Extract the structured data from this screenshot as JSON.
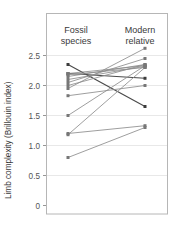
{
  "figure": {
    "background": "#ffffff",
    "frame_color": "#b6b6b6",
    "grid_color": "#e2e2e2"
  },
  "axis": {
    "y_label": "Limb complexity (Brillouin index)",
    "tick_labels": [
      "2.5",
      "2.0",
      "1.5",
      "1.0",
      "0.5",
      "0"
    ],
    "tick_values": [
      2.5,
      2.0,
      1.5,
      1.0,
      0.5,
      0
    ]
  },
  "columns": {
    "left": {
      "line1": "Fossil",
      "line2": "species"
    },
    "right": {
      "line1": "Modern",
      "line2": "relative"
    }
  },
  "chart_data": {
    "type": "line",
    "subtype": "slopegraph",
    "title": "",
    "xlabel": "",
    "ylabel": "Limb complexity (Brillouin index)",
    "ylim": [
      0,
      2.75
    ],
    "grid": true,
    "legend": "none",
    "categories": [
      "Fossil species",
      "Modern relative"
    ],
    "tick_labels": [
      "2.5",
      "2.0",
      "1.5",
      "1.0",
      "0.5",
      "0"
    ],
    "series": [
      {
        "name": "pair-1",
        "values": [
          2.35,
          1.65
        ],
        "color": "#4a4a4a"
      },
      {
        "name": "pair-2",
        "values": [
          2.2,
          2.12
        ],
        "color": "#4a4a4a"
      },
      {
        "name": "pair-3",
        "values": [
          2.2,
          2.33
        ],
        "color": "#8c8c8c"
      },
      {
        "name": "pair-4",
        "values": [
          2.18,
          2.3
        ],
        "color": "#8c8c8c"
      },
      {
        "name": "pair-5",
        "values": [
          2.15,
          2.35
        ],
        "color": "#8c8c8c"
      },
      {
        "name": "pair-6",
        "values": [
          2.1,
          2.32
        ],
        "color": "#8c8c8c"
      },
      {
        "name": "pair-7",
        "values": [
          2.05,
          2.45
        ],
        "color": "#8c8c8c"
      },
      {
        "name": "pair-8",
        "values": [
          2.0,
          2.35
        ],
        "color": "#8c8c8c"
      },
      {
        "name": "pair-9",
        "values": [
          1.95,
          2.62
        ],
        "color": "#8c8c8c"
      },
      {
        "name": "pair-10",
        "values": [
          1.83,
          2.0
        ],
        "color": "#8c8c8c"
      },
      {
        "name": "pair-11",
        "values": [
          1.5,
          2.33
        ],
        "color": "#8c8c8c"
      },
      {
        "name": "pair-12",
        "values": [
          1.2,
          1.33
        ],
        "color": "#8c8c8c"
      },
      {
        "name": "pair-13",
        "values": [
          1.18,
          2.3
        ],
        "color": "#8c8c8c"
      },
      {
        "name": "pair-14",
        "values": [
          0.8,
          1.3
        ],
        "color": "#8c8c8c"
      }
    ]
  }
}
